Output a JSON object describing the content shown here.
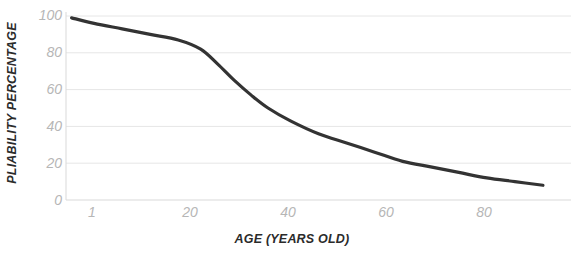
{
  "chart_data": {
    "type": "line",
    "title": "",
    "xlabel": "AGE (YEARS OLD)",
    "ylabel": "PLIABILITY PERCENTAGE",
    "xlim": [
      0,
      90
    ],
    "ylim": [
      0,
      100
    ],
    "grid": true,
    "legend": "none",
    "line_color": "#333333",
    "grid_color": "#e6e6e6",
    "tick_label_color": "#b6b6b6",
    "axis_title_color": "#2b2b2b",
    "background": "#ffffff",
    "x_ticks": [
      1,
      20,
      40,
      60,
      80
    ],
    "x_tick_labels": [
      "1",
      "20",
      "40",
      "60",
      "80"
    ],
    "y_ticks": [
      0,
      20,
      40,
      60,
      80,
      100
    ],
    "y_tick_labels": [
      "0",
      "20",
      "40",
      "60",
      "80",
      "100"
    ],
    "series": [
      {
        "name": "Pliability",
        "x": [
          1,
          5,
          10,
          15,
          20,
          24,
          27,
          30,
          33,
          36,
          40,
          45,
          50,
          55,
          60,
          65,
          70,
          75,
          80,
          85
        ],
        "values": [
          99,
          96,
          93,
          90,
          87,
          82,
          74,
          65,
          57,
          50,
          43,
          36,
          31,
          26,
          21,
          18,
          15,
          12,
          10,
          8
        ]
      }
    ]
  }
}
